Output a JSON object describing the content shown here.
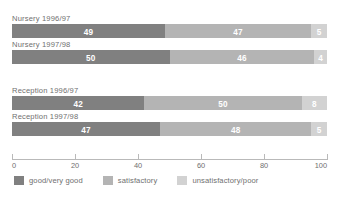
{
  "figure": {
    "clipped_caption": "",
    "background": "#ffffff"
  },
  "chart_data": {
    "type": "bar",
    "orientation": "horizontal",
    "stacked": true,
    "title": "",
    "xlabel": "",
    "ylabel": "",
    "xlim": [
      0,
      100
    ],
    "xticks": [
      0,
      20,
      40,
      60,
      80,
      100
    ],
    "xtick_labels": [
      "0",
      "20",
      "40",
      "60",
      "80",
      "100"
    ],
    "grid": false,
    "legend_position": "bottom",
    "categories": [
      "Nursery 1996/97",
      "Nursery 1997/98",
      "Reception 1996/97",
      "Reception 1997/98"
    ],
    "series": [
      {
        "name": "good/very good",
        "color": "#808080",
        "values": [
          49,
          50,
          42,
          47
        ]
      },
      {
        "name": "satisfactory",
        "color": "#b4b4b4",
        "values": [
          47,
          46,
          50,
          48
        ]
      },
      {
        "name": "unsatisfactory/poor",
        "color": "#d2d2d2",
        "values": [
          5,
          4,
          8,
          5
        ]
      }
    ],
    "bar_value_labels": [
      [
        "49",
        "47",
        "5"
      ],
      [
        "50",
        "46",
        "4"
      ],
      [
        "42",
        "50",
        "8"
      ],
      [
        "47",
        "48",
        "5"
      ]
    ]
  },
  "legend": {
    "items": [
      {
        "label": "good/very good",
        "color": "#808080"
      },
      {
        "label": "satisfactory",
        "color": "#b4b4b4"
      },
      {
        "label": "unsatisfactory/poor",
        "color": "#d2d2d2"
      }
    ]
  }
}
